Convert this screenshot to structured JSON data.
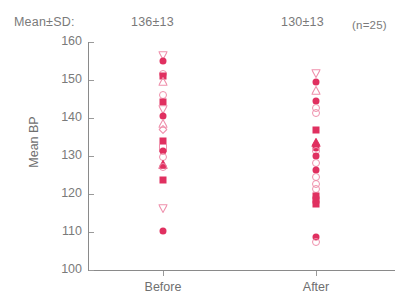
{
  "header": {
    "mean_sd_label": "Mean±SD:",
    "before_value": "136±13",
    "after_value": "130±13",
    "n_label": "(n=25)"
  },
  "colors": {
    "marker_filled": "#e03060",
    "marker_open": "#ef90ac",
    "axis": "#8a8a8a",
    "text": "#6f6f6f",
    "background": "#ffffff"
  },
  "chart_data": {
    "type": "scatter",
    "title": "",
    "xlabel": "",
    "ylabel": "Mean BP",
    "ylim": [
      100,
      160
    ],
    "yticks": [
      100,
      110,
      120,
      130,
      140,
      150,
      160
    ],
    "ytick_labels": [
      "100",
      "110",
      "120",
      "130",
      "140",
      "150",
      "160"
    ],
    "grid": false,
    "legend": "none",
    "categories": [
      "Before",
      "After"
    ],
    "n": 25,
    "summary": {
      "Before": {
        "mean": 136,
        "sd": 13,
        "label": "136±13"
      },
      "After": {
        "mean": 130,
        "sd": 13,
        "label": "130±13"
      }
    },
    "series": [
      {
        "name": "Before",
        "x_category": "Before",
        "points": [
          {
            "value": 156.6,
            "marker": "triangle-down-open"
          },
          {
            "value": 155.0,
            "marker": "circle-filled"
          },
          {
            "value": 151.6,
            "marker": "circle-open"
          },
          {
            "value": 151.0,
            "marker": "square-filled"
          },
          {
            "value": 149.8,
            "marker": "triangle-up-open"
          },
          {
            "value": 146.0,
            "marker": "circle-open"
          },
          {
            "value": 144.2,
            "marker": "square-filled"
          },
          {
            "value": 142.3,
            "marker": "triangle-down-open"
          },
          {
            "value": 140.6,
            "marker": "circle-filled"
          },
          {
            "value": 138.8,
            "marker": "triangle-up-open"
          },
          {
            "value": 137.2,
            "marker": "diamond-open"
          },
          {
            "value": 134.0,
            "marker": "square-filled"
          },
          {
            "value": 132.2,
            "marker": "square-open"
          },
          {
            "value": 131.2,
            "marker": "circle-filled"
          },
          {
            "value": 129.8,
            "marker": "circle-open"
          },
          {
            "value": 128.0,
            "marker": "triangle-up-filled"
          },
          {
            "value": 127.0,
            "marker": "circle-open"
          },
          {
            "value": 123.6,
            "marker": "square-filled"
          },
          {
            "value": 116.4,
            "marker": "triangle-down-open"
          },
          {
            "value": 110.2,
            "marker": "circle-filled"
          }
        ]
      },
      {
        "name": "After",
        "x_category": "After",
        "points": [
          {
            "value": 151.8,
            "marker": "triangle-down-open"
          },
          {
            "value": 149.6,
            "marker": "circle-filled"
          },
          {
            "value": 147.4,
            "marker": "triangle-up-open"
          },
          {
            "value": 144.4,
            "marker": "circle-filled"
          },
          {
            "value": 142.6,
            "marker": "circle-open"
          },
          {
            "value": 141.4,
            "marker": "circle-open"
          },
          {
            "value": 136.8,
            "marker": "square-filled"
          },
          {
            "value": 133.6,
            "marker": "triangle-up-filled"
          },
          {
            "value": 132.2,
            "marker": "circle-filled"
          },
          {
            "value": 131.2,
            "marker": "circle-open"
          },
          {
            "value": 130.0,
            "marker": "circle-filled"
          },
          {
            "value": 128.2,
            "marker": "circle-open"
          },
          {
            "value": 126.4,
            "marker": "circle-filled"
          },
          {
            "value": 124.6,
            "marker": "circle-open"
          },
          {
            "value": 122.6,
            "marker": "circle-open"
          },
          {
            "value": 121.4,
            "marker": "circle-open"
          },
          {
            "value": 119.6,
            "marker": "square-filled"
          },
          {
            "value": 118.4,
            "marker": "square-filled"
          },
          {
            "value": 117.4,
            "marker": "square-filled"
          },
          {
            "value": 108.8,
            "marker": "circle-filled"
          },
          {
            "value": 107.4,
            "marker": "circle-open"
          }
        ]
      }
    ]
  }
}
